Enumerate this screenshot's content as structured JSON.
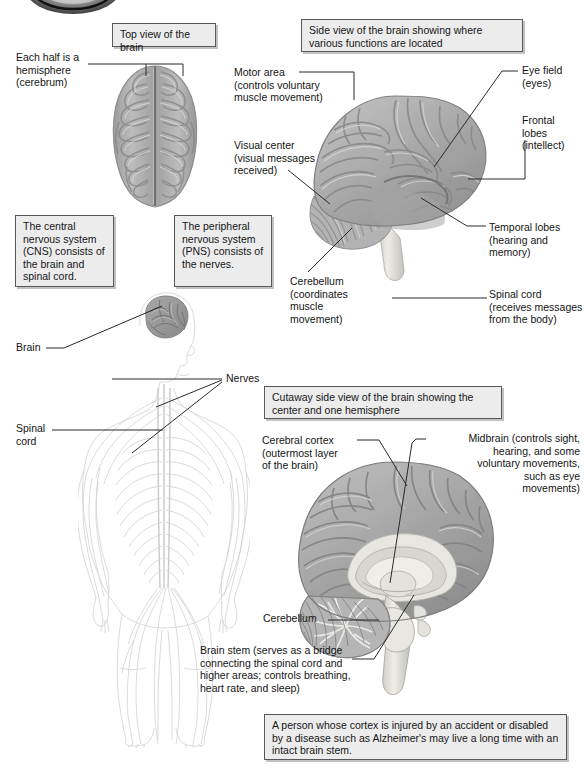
{
  "figure": {
    "title_boxes": {
      "top_view": "Top view of the brain",
      "side_view": "Side view of the brain showing where\nvarious functions are located",
      "cutaway": "Cutaway side view of the brain showing\nthe center and one hemisphere"
    },
    "info_boxes": {
      "cns": "The central\nnervous system\n(CNS) consists\nof the brain and\nspinal cord.",
      "pns": "The peripheral\nnervous system\n(PNS) consists\nof the nerves.",
      "footnote": "A person whose cortex is injured by an accident or\ndisabled by a disease such as Alzheimer's may live a\nlong time with an intact brain stem."
    },
    "labels": {
      "hemisphere": "Each half is a\nhemisphere\n(cerebrum)",
      "motor_area": "Motor area\n(controls voluntary\nmuscle movement)",
      "visual_center": "Visual center\n(visual messages\nreceived)",
      "eye_field": "Eye field\n(eyes)",
      "frontal_lobes": "Frontal\nlobes\n(intellect)",
      "temporal_lobes": "Temporal lobes\n(hearing and\nmemory)",
      "cerebellum_side": "Cerebellum\n(coordinates\nmuscle\nmovement)",
      "spinal_cord_side": "Spinal cord\n(receives messages\nfrom the body)",
      "brain_body": "Brain",
      "nerves": "Nerves",
      "spinal_cord_body": "Spinal\ncord",
      "cerebral_cortex": "Cerebral cortex\n(outermost layer\nof the brain)",
      "midbrain": "Midbrain (controls sight,\nhearing, and some\nvoluntary movements,\nsuch as eye\nmovements)",
      "cerebellum_cut": "Cerebellum",
      "brain_stem": "Brain stem (serves as a bridge\nconnecting the spinal cord and\nhigher areas; controls breathing,\nheart rate, and sleep)"
    },
    "colors": {
      "box_fill": "#ececed",
      "box_border": "#58585a",
      "leader": "#2b2b2b",
      "brain_mid": "#a8a8a8",
      "brain_light": "#cfcfcf",
      "brain_dark": "#8c8c8c",
      "brain_stem_fill": "#e2e2e0",
      "body_outline": "#d4d4d6",
      "text": "#141414"
    }
  }
}
